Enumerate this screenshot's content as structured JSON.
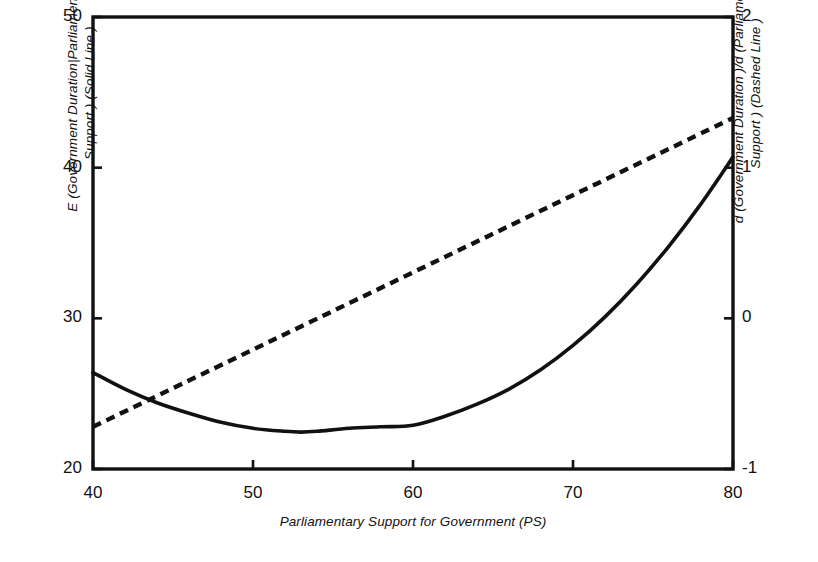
{
  "chart_data": {
    "type": "line",
    "title": "",
    "xlabel": "Parliamentary Support for Government (PS)",
    "ylabel_left": "E (Government Duration|Parliamentary\nSupport ) (Solid Line )",
    "ylabel_right": "d (Government Duration )/d (Parliamentary\nSupport ) (Dashed Line )",
    "xlim": [
      40,
      80
    ],
    "ylim_left": [
      20,
      50
    ],
    "ylim_right": [
      -1,
      2
    ],
    "xticks": [
      "40",
      "50",
      "60",
      "70",
      "80"
    ],
    "xtick_values": [
      40,
      50,
      60,
      70,
      80
    ],
    "yticks_left": [
      "50",
      "40",
      "30",
      "20"
    ],
    "ytick_left_values": [
      50,
      40,
      30,
      20
    ],
    "yticks_right": [
      "2",
      "1",
      "0",
      "-1"
    ],
    "ytick_right_values": [
      2,
      1,
      0,
      -1
    ],
    "grid": false,
    "legend": "inline-in-axis-labels",
    "series": [
      {
        "name": "E (Government Duration | Parliamentary Support ) (Solid Line )",
        "axis": "left",
        "style": "solid",
        "color": "#111111",
        "x": [
          40,
          42,
          44,
          46,
          48,
          50,
          52,
          53,
          54,
          56,
          58,
          60,
          62,
          64,
          66,
          68,
          70,
          72,
          74,
          76,
          78,
          80
        ],
        "y": [
          26.4,
          25.3,
          24.4,
          23.7,
          23.1,
          22.7,
          22.5,
          22.45,
          22.5,
          22.7,
          22.8,
          22.9,
          23.5,
          24.3,
          25.3,
          26.6,
          28.2,
          30.1,
          32.3,
          34.8,
          37.6,
          40.7
        ]
      },
      {
        "name": "d (Government Duration )/d (Parliamentary Support ) (Dashed Line )",
        "axis": "right",
        "style": "dashed",
        "color": "#111111",
        "x": [
          40,
          80
        ],
        "y": [
          -0.72,
          1.33
        ]
      }
    ],
    "annotations": []
  },
  "axes": {
    "left_title": "E (Government Duration|Parliamentary\nSupport ) (Solid Line )",
    "right_title": "d (Government Duration )/d (Parliamentary\nSupport ) (Dashed Line )",
    "bottom_title": "Parliamentary Support for Government (PS)"
  },
  "colors": {
    "ink": "#111111",
    "background": "#ffffff"
  }
}
